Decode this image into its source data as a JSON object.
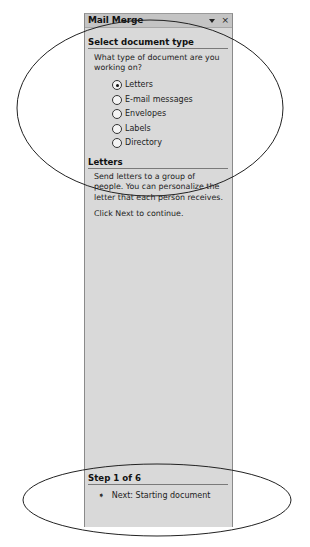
{
  "pane": {
    "title": "Mail Merge",
    "icons": {
      "dropdown": "dropdown-arrow-icon",
      "close": "close-icon",
      "close_glyph": "×"
    }
  },
  "select_section": {
    "heading": "Select document type",
    "question": "What type of document are you working on?",
    "options": [
      {
        "label": "Letters",
        "checked": true
      },
      {
        "label": "E-mail messages",
        "checked": false
      },
      {
        "label": "Envelopes",
        "checked": false
      },
      {
        "label": "Labels",
        "checked": false
      },
      {
        "label": "Directory",
        "checked": false
      }
    ]
  },
  "letters_section": {
    "heading": "Letters",
    "description": "Send letters to a group of people. You can personalize the letter that each person receives.",
    "instruction": "Click Next to continue."
  },
  "step_section": {
    "heading": "Step 1 of 6",
    "next_arrow": "➧",
    "next_label": "Next: Starting document"
  },
  "colors": {
    "pane_bg": "#d9d9d9",
    "titlebar_bg": "#c4c4c4",
    "annotation_stroke": "#222222"
  }
}
